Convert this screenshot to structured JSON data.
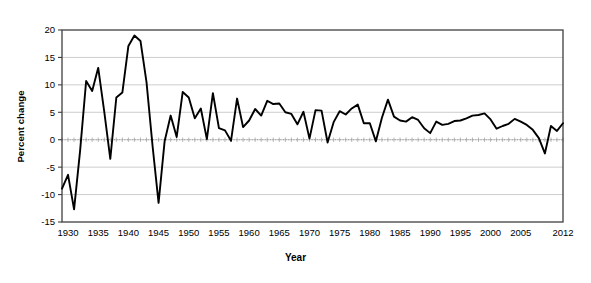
{
  "chart_data": {
    "type": "line",
    "title": "",
    "xlabel": "Year",
    "ylabel": "Percent change",
    "xlim": [
      1929,
      2012
    ],
    "ylim": [
      -15,
      20
    ],
    "ytick_step": 5,
    "xtick_step": 5,
    "grid": true,
    "grid_axis": "y",
    "legend": false,
    "line_color": "#000000",
    "grid_color": "#c0c0c0",
    "axis_color": "#404040",
    "background": "#ffffff",
    "yticks": [
      -15,
      -10,
      -5,
      0,
      5,
      10,
      15,
      20
    ],
    "ytick_labels": [
      "-15",
      "-10",
      "-5",
      "0",
      "5",
      "10",
      "15",
      "20"
    ],
    "xticks": [
      1930,
      1935,
      1940,
      1945,
      1950,
      1955,
      1960,
      1965,
      1970,
      1975,
      1980,
      1985,
      1990,
      1995,
      2000,
      2005,
      2012
    ],
    "xtick_labels": [
      "1930",
      "1935",
      "1940",
      "1945",
      "1950",
      "1955",
      "1960",
      "1965",
      "1970",
      "1975",
      "1980",
      "1985",
      "1990",
      "1995",
      "2000",
      "2005",
      "2012"
    ],
    "x": [
      1929,
      1930,
      1931,
      1932,
      1933,
      1934,
      1935,
      1936,
      1937,
      1938,
      1939,
      1940,
      1941,
      1942,
      1943,
      1944,
      1945,
      1946,
      1947,
      1948,
      1949,
      1950,
      1951,
      1952,
      1953,
      1954,
      1955,
      1956,
      1957,
      1958,
      1959,
      1960,
      1961,
      1962,
      1963,
      1964,
      1965,
      1966,
      1967,
      1968,
      1969,
      1970,
      1971,
      1972,
      1973,
      1974,
      1975,
      1976,
      1977,
      1978,
      1979,
      1980,
      1981,
      1982,
      1983,
      1984,
      1985,
      1986,
      1987,
      1988,
      1989,
      1990,
      1991,
      1992,
      1993,
      1994,
      1995,
      1996,
      1997,
      1998,
      1999,
      2000,
      2001,
      2002,
      2003,
      2004,
      2005,
      2006,
      2007,
      2008,
      2009,
      2010,
      2011,
      2012
    ],
    "values": [
      -8.9,
      -6.4,
      -12.7,
      -2.0,
      10.7,
      8.9,
      13.1,
      5.1,
      -3.5,
      7.7,
      8.6,
      17.1,
      19.0,
      18.0,
      10.5,
      -1.1,
      -11.5,
      -0.3,
      4.4,
      0.5,
      8.7,
      7.7,
      3.9,
      5.7,
      0.1,
      8.5,
      2.1,
      1.7,
      -0.2,
      7.5,
      2.3,
      3.5,
      5.6,
      4.4,
      7.1,
      6.5,
      6.6,
      5.0,
      4.7,
      2.8,
      5.1,
      0.2,
      5.4,
      5.3,
      -0.5,
      3.2,
      5.2,
      4.6,
      5.7,
      6.4,
      3.0,
      3.0,
      -0.3,
      4.0,
      7.3,
      4.2,
      3.5,
      3.3,
      4.1,
      3.6,
      2.1,
      1.2,
      3.3,
      2.7,
      2.9,
      3.4,
      3.5,
      3.9,
      4.4,
      4.5,
      4.8,
      3.7,
      2.0,
      2.5,
      2.9,
      3.8,
      3.3,
      2.7,
      1.8,
      0.3,
      -2.5,
      2.5,
      1.6,
      3.0
    ]
  }
}
